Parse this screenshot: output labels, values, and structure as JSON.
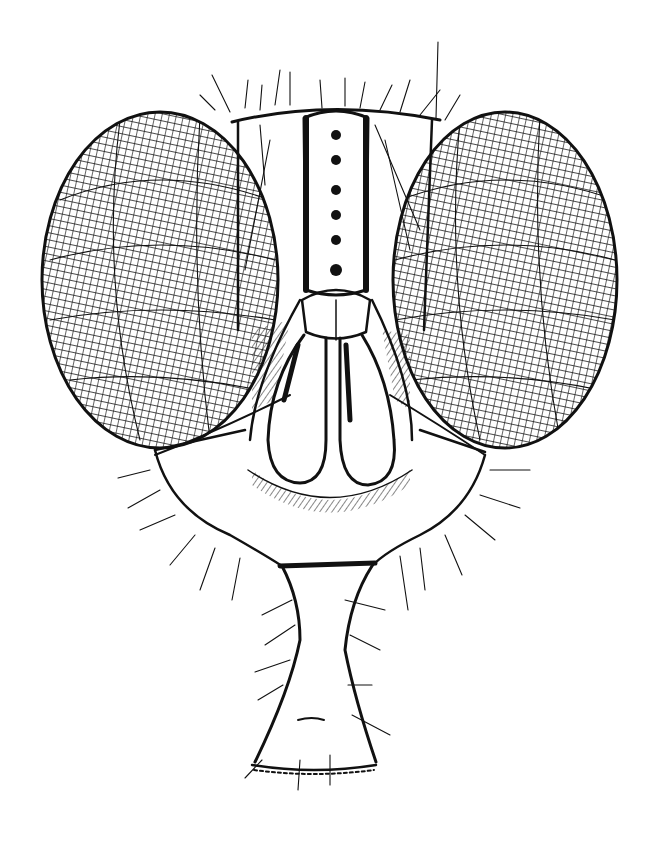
{
  "illustration": {
    "subject": "fly head, frontal view",
    "style": "black ink line drawing on white",
    "colors": {
      "background": "#ffffff",
      "ink": "#111111"
    }
  },
  "parts": {
    "left_eye": {
      "cx": 160,
      "cy": 280,
      "rx": 118,
      "ry": 168
    },
    "right_eye": {
      "cx": 505,
      "cy": 280,
      "rx": 112,
      "ry": 168
    },
    "frons_stripe": {
      "x": 300,
      "y": 110,
      "w": 72,
      "h": 185
    },
    "antennae": [
      {
        "x": 268,
        "y": 305,
        "w": 58,
        "h": 178
      },
      {
        "x": 332,
        "y": 305,
        "w": 58,
        "h": 178
      }
    ],
    "lower_face": {
      "top": 445,
      "bottom": 568
    },
    "proboscis": {
      "top": 565,
      "base_y": 773,
      "base_left": 250,
      "base_right": 376
    }
  }
}
